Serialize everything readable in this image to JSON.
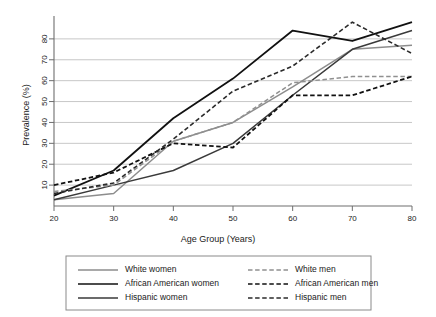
{
  "chart_data": {
    "type": "line",
    "title": "",
    "xlabel": "Age Group (Years)",
    "ylabel": "Prevalence (%)",
    "x": [
      20,
      30,
      40,
      50,
      60,
      70,
      80
    ],
    "xlim": [
      20,
      80
    ],
    "ylim": [
      0,
      90
    ],
    "xticks": [
      20,
      30,
      40,
      50,
      60,
      70,
      80
    ],
    "yticks": [
      10,
      20,
      30,
      40,
      50,
      60,
      70,
      80
    ],
    "xtick_labels": [
      "20",
      "30",
      "40",
      "50",
      "60",
      "70",
      "80"
    ],
    "ytick_labels": [
      "10",
      "20",
      "30",
      "40",
      "50",
      "60",
      "70",
      "80"
    ],
    "grid": true,
    "grid_axis": "y",
    "legend_position": "below",
    "legend_columns": 2,
    "series": [
      {
        "name": "White women",
        "values": [
          3,
          6,
          31,
          40,
          57,
          75,
          77
        ],
        "color": "#8d8d8d",
        "style": "solid",
        "width": 1.5
      },
      {
        "name": "African American women",
        "values": [
          5,
          17,
          42,
          61,
          84,
          79,
          88
        ],
        "color": "#111111",
        "style": "solid",
        "width": 1.8
      },
      {
        "name": "Hispanic women",
        "values": [
          3,
          10,
          17,
          30,
          53,
          75,
          84
        ],
        "color": "#3a3a3a",
        "style": "solid",
        "width": 1.5
      },
      {
        "name": "White men",
        "values": [
          7,
          10,
          31,
          40,
          59,
          62,
          62
        ],
        "color": "#909090",
        "style": "dashed",
        "width": 1.5
      },
      {
        "name": "African American men",
        "values": [
          10,
          16,
          30,
          28,
          53,
          53,
          62
        ],
        "color": "#111111",
        "style": "dashed",
        "width": 1.8
      },
      {
        "name": "Hispanic men",
        "values": [
          6,
          11,
          32,
          55,
          67,
          88,
          73
        ],
        "color": "#2b2b2b",
        "style": "dashed",
        "width": 1.6
      }
    ]
  },
  "legend": {
    "entries": [
      {
        "label": "White women",
        "column": 0
      },
      {
        "label": "African American women",
        "column": 0
      },
      {
        "label": "Hispanic women",
        "column": 0
      },
      {
        "label": "White men",
        "column": 1
      },
      {
        "label": "African American men",
        "column": 1
      },
      {
        "label": "Hispanic men",
        "column": 1
      }
    ]
  },
  "colors": {
    "grid": "#b9b9b9",
    "axis": "#6e6e6e",
    "text": "#1a1a1a",
    "legend_border": "#8a8a8a",
    "background": "#ffffff"
  }
}
